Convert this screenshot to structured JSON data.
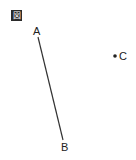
{
  "figure": {
    "label": "図"
  },
  "diagram": {
    "points": [
      {
        "name": "A",
        "x": 38,
        "y": 37,
        "label_x": 33,
        "label_y": 35
      },
      {
        "name": "B",
        "x": 63,
        "y": 140,
        "label_x": 62,
        "label_y": 151
      },
      {
        "name": "C",
        "x": 115,
        "y": 56,
        "label_x": 119,
        "label_y": 60
      }
    ],
    "segments": [
      {
        "from": "A",
        "to": "B"
      }
    ],
    "labels": {
      "A": "A",
      "B": "B",
      "C": "C"
    },
    "colors": {
      "line": "#333333",
      "text": "#222222"
    }
  }
}
